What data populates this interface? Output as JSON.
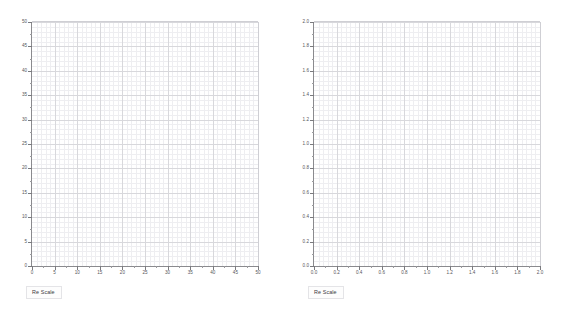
{
  "page": {
    "background_color": "#ffffff",
    "width": 564,
    "height": 318
  },
  "style": {
    "grid_major_color": "#d8d8dc",
    "grid_minor_color": "#eeeef1",
    "axis_color": "#8a8a8e",
    "tick_label_color": "#55555a",
    "button_text_color": "#3a3a3e",
    "button_border_color": "#e4e4e7"
  },
  "panels": [
    {
      "id": "left",
      "rescale_label": "Re Scale",
      "chart_data": {
        "type": "scatter",
        "title": "",
        "subtitle": "",
        "xlabel": "",
        "ylabel": "",
        "series": [],
        "x": [],
        "values": [],
        "xlim": [
          0,
          50
        ],
        "ylim": [
          0,
          50
        ],
        "xticks": [
          0,
          5,
          10,
          15,
          20,
          25,
          30,
          35,
          40,
          45,
          50
        ],
        "yticks": [
          0,
          5,
          10,
          15,
          20,
          25,
          30,
          35,
          40,
          45,
          50
        ],
        "xtick_labels": [
          "0",
          "5",
          "10",
          "15",
          "20",
          "25",
          "30",
          "35",
          "40",
          "45",
          "50"
        ],
        "ytick_labels": [
          "0",
          "5",
          "10",
          "15",
          "20",
          "25",
          "30",
          "35",
          "40",
          "45",
          "50"
        ],
        "x_minor_interval": 1,
        "y_minor_interval": 1,
        "x_major_interval": 5,
        "y_major_interval": 5,
        "grid": true,
        "minor_grid": true,
        "legend": false,
        "legend_position": "none",
        "annotations": [],
        "empty": true
      }
    },
    {
      "id": "right",
      "rescale_label": "Re Scale",
      "chart_data": {
        "type": "scatter",
        "title": "",
        "subtitle": "",
        "xlabel": "",
        "ylabel": "",
        "series": [],
        "x": [],
        "values": [],
        "xlim": [
          0.0,
          2.0
        ],
        "ylim": [
          0.0,
          2.0
        ],
        "xticks": [
          0.0,
          0.2,
          0.4,
          0.6,
          0.8,
          1.0,
          1.2,
          1.4,
          1.6,
          1.8,
          2.0
        ],
        "yticks": [
          0.0,
          0.2,
          0.4,
          0.6,
          0.8,
          1.0,
          1.2,
          1.4,
          1.6,
          1.8,
          2.0
        ],
        "xtick_labels": [
          "0.0",
          "0.2",
          "0.4",
          "0.6",
          "0.8",
          "1.0",
          "1.2",
          "1.4",
          "1.6",
          "1.8",
          "2.0"
        ],
        "ytick_labels": [
          "0.0",
          "0.2",
          "0.4",
          "0.6",
          "0.8",
          "1.0",
          "1.2",
          "1.4",
          "1.6",
          "1.8",
          "2.0"
        ],
        "x_minor_interval": 0.04,
        "y_minor_interval": 0.04,
        "x_major_interval": 0.2,
        "y_major_interval": 0.2,
        "grid": true,
        "minor_grid": true,
        "legend": false,
        "legend_position": "none",
        "annotations": [],
        "empty": true
      }
    }
  ]
}
